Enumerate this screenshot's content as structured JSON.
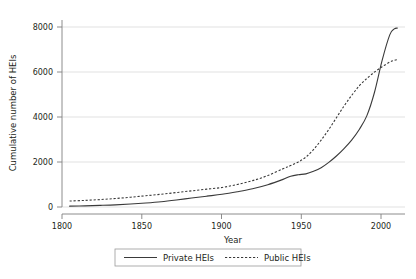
{
  "chart_data": {
    "type": "line",
    "title": "",
    "xlabel": "Year",
    "ylabel": "Cumulative number of HEIs",
    "xlim": [
      1795,
      2020
    ],
    "ylim": [
      0,
      8800
    ],
    "xticks": [
      1800,
      1850,
      1900,
      1950,
      2000
    ],
    "xtick_labels": [
      "1800",
      "1850",
      "1900",
      "1950",
      "2000"
    ],
    "yticks": [
      0,
      2000,
      4000,
      6000,
      8000
    ],
    "ytick_labels": [
      "0",
      "2000",
      "4000",
      "6000",
      "8000"
    ],
    "grid": "horizontal",
    "legend_position": "bottom-center",
    "series": [
      {
        "name": "Private HEIs",
        "style": "solid",
        "color": "#3a3a3a",
        "x": [
          1800,
          1810,
          1820,
          1830,
          1840,
          1850,
          1860,
          1870,
          1880,
          1890,
          1900,
          1910,
          1920,
          1930,
          1940,
          1945,
          1950,
          1955,
          1960,
          1965,
          1970,
          1975,
          1980,
          1985,
          1990,
          1995,
          2000,
          2005,
          2010,
          2013,
          2015
        ],
        "y": [
          40,
          55,
          75,
          100,
          140,
          190,
          250,
          330,
          420,
          510,
          600,
          720,
          860,
          1050,
          1300,
          1450,
          1520,
          1560,
          1680,
          1850,
          2100,
          2400,
          2750,
          3150,
          3650,
          4300,
          5400,
          6900,
          8100,
          8380,
          8420
        ]
      },
      {
        "name": "Public HEIs",
        "style": "dotted",
        "color": "#3a3a3a",
        "x": [
          1800,
          1810,
          1820,
          1830,
          1840,
          1850,
          1860,
          1870,
          1880,
          1890,
          1900,
          1910,
          1920,
          1930,
          1940,
          1945,
          1950,
          1955,
          1960,
          1965,
          1970,
          1975,
          1980,
          1985,
          1990,
          1995,
          2000,
          2005,
          2010,
          2013,
          2015
        ],
        "y": [
          280,
          310,
          350,
          400,
          460,
          530,
          600,
          680,
          760,
          840,
          920,
          1060,
          1240,
          1480,
          1800,
          1950,
          2120,
          2350,
          2700,
          3150,
          3650,
          4200,
          4750,
          5250,
          5700,
          6050,
          6350,
          6600,
          6820,
          6900,
          6930
        ]
      }
    ],
    "annotations": {
      "crossover_year": 2003,
      "crossover_value": 4700
    }
  },
  "legend": {
    "items": [
      {
        "label": "Private HEIs",
        "style": "solid"
      },
      {
        "label": "Public HEIs",
        "style": "dotted"
      }
    ]
  }
}
